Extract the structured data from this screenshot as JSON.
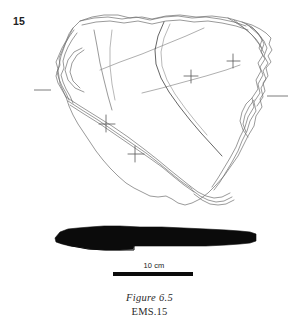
{
  "plate": {
    "catalogue_number": "15",
    "background_color": "#ffffff",
    "ink_color": "#6b6b6b",
    "profile_fill_color": "#0b0b0b"
  },
  "scale": {
    "label": "10 cm",
    "bar_color": "#0b0b0b"
  },
  "caption": {
    "figure_label": "Figure 6.5",
    "reference": "EMS.15"
  },
  "drawing": {
    "plan_outline_name": "stone-plan-outline",
    "profile_name": "stone-profile-section",
    "registration_tick_left": "axis-tick-left",
    "registration_tick_right": "axis-tick-right"
  }
}
